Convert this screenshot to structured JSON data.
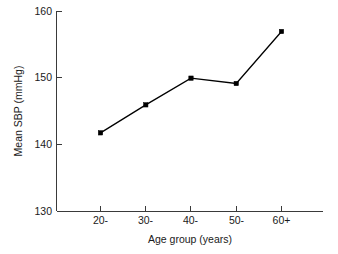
{
  "chart_data": {
    "type": "line",
    "title": "",
    "xlabel": "Age group (years)",
    "ylabel": "Mean SBP (mmHg)",
    "categories": [
      "20-",
      "30-",
      "40-",
      "50-",
      "60+"
    ],
    "values": [
      141.8,
      146.0,
      150.0,
      149.2,
      157.0
    ],
    "ylim": [
      130,
      160
    ],
    "yticks": [
      130,
      140,
      150,
      160
    ],
    "ytick_labels": [
      "130",
      "140",
      "150",
      "160"
    ],
    "xtick_labels": [
      "20-",
      "30-",
      "40-",
      "50-",
      "60+"
    ],
    "grid": false,
    "legend": false,
    "legend_position": "none",
    "marker": "filled-square",
    "line_color": "#000000",
    "background_color": "#ffffff",
    "axis_color": "#3a3a3a"
  },
  "axes": {
    "y_title": "Mean SBP (mmHg)",
    "x_title": "Age group (years)"
  }
}
